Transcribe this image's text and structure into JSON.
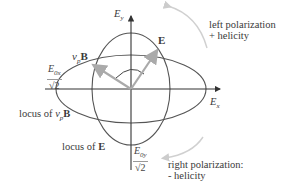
{
  "diagram": {
    "axes": {
      "x_label": "E",
      "x_sub": "x",
      "y_label": "E",
      "y_sub": "y"
    },
    "vectors": {
      "E_label": "E",
      "B_label_prefix": "v",
      "B_label_sub": "p",
      "B_label_bold": "B"
    },
    "fractions": {
      "x_numerator": "E",
      "x_num_sub": "0x",
      "x_denominator": "√2",
      "y_numerator": "E",
      "y_num_sub": "0y",
      "y_denominator": "√2"
    },
    "annotations": {
      "left_line1": "left polarization",
      "left_line2": "+ helicity",
      "right_line1": "right polarization:",
      "right_line2": "- helicity",
      "locus_B_prefix": "locus of ",
      "locus_B_v": "v",
      "locus_B_sub": "p",
      "locus_B_bold": "B",
      "locus_E_prefix": "locus of ",
      "locus_E_bold": "E"
    },
    "colors": {
      "axis": "#333333",
      "ellipse": "#555555",
      "vector": "#aaaaaa",
      "rotation_arc": "#cccccc"
    }
  }
}
